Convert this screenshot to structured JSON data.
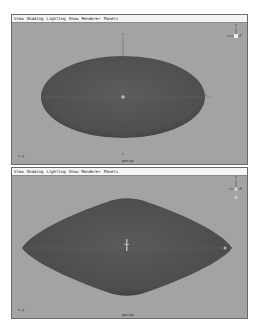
{
  "viewports": [
    {
      "id": "top",
      "menu": [
        "View",
        "Shading",
        "Lighting",
        "Show",
        "Renderer",
        "Panels"
      ],
      "camera_label": "persp",
      "axis_corner_label": "x-y",
      "view_axis_labels": {
        "up": "y",
        "right": "x"
      },
      "shape": "ellipsoid"
    },
    {
      "id": "bottom",
      "menu": [
        "View",
        "Shading",
        "Lighting",
        "Show",
        "Renderer",
        "Panels"
      ],
      "camera_label": "persp",
      "axis_corner_label": "x-y",
      "view_axis_labels": {
        "up": "y",
        "right": "x"
      },
      "shape": "spindle"
    }
  ],
  "colors": {
    "viewport_bg": "#a3a3a3",
    "shape_fill": "#545454",
    "menubar_bg": "#f4f4f4"
  }
}
